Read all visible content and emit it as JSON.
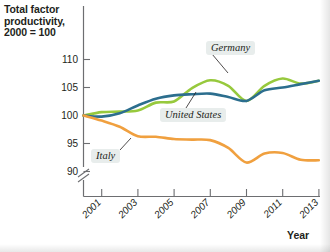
{
  "chart_data": {
    "type": "line",
    "title": "Total factor productivity, 2000 = 100",
    "xlabel": "Year",
    "ylabel": "",
    "grid": false,
    "legend_position": "inline-annotations",
    "axis_break": true,
    "xlim": [
      2000,
      2013
    ],
    "ylim": [
      88,
      112
    ],
    "ytick_labels": [
      "110",
      "105",
      "100",
      "95",
      "90"
    ],
    "ytick_values": [
      110,
      105,
      100,
      95,
      90
    ],
    "xtick_labels": [
      "2001",
      "2003",
      "2005",
      "2007",
      "2009",
      "2011",
      "2013"
    ],
    "xtick_values": [
      2001,
      2003,
      2005,
      2007,
      2009,
      2011,
      2013
    ],
    "x": [
      2000,
      2001,
      2002,
      2003,
      2004,
      2005,
      2006,
      2007,
      2008,
      2009,
      2010,
      2011,
      2012,
      2013
    ],
    "series": [
      {
        "name": "Germany",
        "color": "#97c93d",
        "values": [
          100.0,
          100.6,
          100.7,
          100.9,
          102.3,
          102.5,
          104.9,
          106.3,
          105.3,
          102.6,
          105.3,
          106.6,
          105.7,
          106.2
        ]
      },
      {
        "name": "United States",
        "color": "#2c6e8e",
        "values": [
          100.0,
          99.8,
          100.4,
          101.8,
          103.0,
          103.6,
          103.8,
          103.9,
          103.3,
          102.6,
          104.5,
          105.0,
          105.6,
          106.2
        ]
      },
      {
        "name": "Italy",
        "color": "#f0a03f",
        "values": [
          100.0,
          99.1,
          98.0,
          96.3,
          96.2,
          95.8,
          95.7,
          95.6,
          94.2,
          91.6,
          93.2,
          93.3,
          92.1,
          92.0
        ]
      }
    ]
  },
  "annotations": [
    {
      "name": "germany",
      "label": "Germany"
    },
    {
      "name": "united-states",
      "label": "United States"
    },
    {
      "name": "italy",
      "label": "Italy"
    }
  ],
  "colors": {
    "germany": "#97c93d",
    "united_states": "#2c6e8e",
    "italy": "#f0a03f",
    "axis": "#6d6e71",
    "text": "#231f20",
    "label_background": "#e8edec"
  }
}
